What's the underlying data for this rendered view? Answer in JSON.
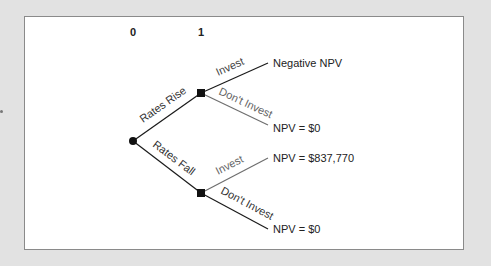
{
  "diagram": {
    "type": "decision-tree",
    "time_labels": [
      "0",
      "1"
    ],
    "branches": {
      "rates_rise": "Rates Rise",
      "rates_fall": "Rates Fall",
      "invest": "Invest",
      "dont_invest": "Don't Invest"
    },
    "outcomes": {
      "rise_invest": "Negative NPV",
      "rise_dont_invest": "NPV = $0",
      "fall_invest": "NPV = $837,770",
      "fall_dont_invest": "NPV = $0"
    },
    "colors": {
      "frame": "#e2e2e2",
      "panel": "#ffffff",
      "line_dark": "#1a1a1a",
      "line_gray": "#6e6e6e",
      "text": "#222222",
      "text_gray": "#555555"
    }
  }
}
